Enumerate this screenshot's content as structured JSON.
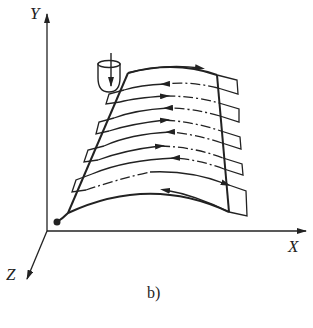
{
  "figure": {
    "caption": "b)",
    "axes": {
      "x_label": "X",
      "y_label": "Y",
      "z_label": "Z"
    },
    "tool": {
      "icon": "ball-end-mill-icon"
    },
    "start_point": {
      "icon": "start-dot-icon"
    },
    "passes": [
      {
        "index": 1,
        "direction": "right",
        "style": "solid"
      },
      {
        "index": 2,
        "direction": "left",
        "style": "dash-dot"
      },
      {
        "index": 3,
        "direction": "right",
        "style": "dash-dot"
      },
      {
        "index": 4,
        "direction": "left",
        "style": "dash-dot"
      },
      {
        "index": 5,
        "direction": "right",
        "style": "dash-dot"
      },
      {
        "index": 6,
        "direction": "left",
        "style": "dash-dot"
      },
      {
        "index": 7,
        "direction": "right",
        "style": "dash-dot"
      },
      {
        "index": 8,
        "direction": "left",
        "style": "dash-dot"
      },
      {
        "index": 9,
        "direction": "right",
        "style": "dash-dot"
      },
      {
        "index": 10,
        "direction": "left",
        "style": "solid"
      }
    ],
    "colors": {
      "ink": "#222222",
      "background": "#ffffff"
    }
  }
}
